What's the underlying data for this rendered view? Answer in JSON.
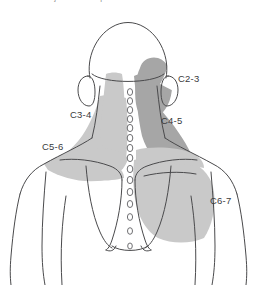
{
  "figure": {
    "title_clipped": "Cervical facet joint referral patterns",
    "view": "posterior view of head, neck and upper back",
    "background_color": "#ffffff",
    "outline_color": "#4a4a4c",
    "zone_fill_light": "#c9c9c9",
    "zone_fill_dark": "#a6a6a6",
    "label_color": "#3a3a3c"
  },
  "labels": [
    {
      "id": "c2-3",
      "text": "C2-3",
      "x": 178,
      "y": 82
    },
    {
      "id": "c3-4",
      "text": "C3-4",
      "x": 70,
      "y": 118
    },
    {
      "id": "c4-5",
      "text": "C4-5",
      "x": 161,
      "y": 124
    },
    {
      "id": "c5-6",
      "text": "C5-6",
      "x": 42,
      "y": 150
    },
    {
      "id": "c6-7",
      "text": "C6-7",
      "x": 210,
      "y": 204
    }
  ],
  "spine": {
    "name": "cervicothoracic spinous processes",
    "marker_color": "#6f6f72",
    "markers": [
      {
        "cx": 130,
        "cy": 92,
        "rx": 2.6,
        "ry": 3.4
      },
      {
        "cx": 130,
        "cy": 101,
        "rx": 2.6,
        "ry": 3.4
      },
      {
        "cx": 130,
        "cy": 110,
        "rx": 2.7,
        "ry": 3.5
      },
      {
        "cx": 130,
        "cy": 119,
        "rx": 2.7,
        "ry": 3.5
      },
      {
        "cx": 130,
        "cy": 128,
        "rx": 2.8,
        "ry": 3.6
      },
      {
        "cx": 130,
        "cy": 138,
        "rx": 2.8,
        "ry": 3.6
      },
      {
        "cx": 130,
        "cy": 148,
        "rx": 2.8,
        "ry": 3.6
      },
      {
        "cx": 130,
        "cy": 158,
        "rx": 2.8,
        "ry": 3.6
      },
      {
        "cx": 130,
        "cy": 169,
        "rx": 2.8,
        "ry": 3.6
      },
      {
        "cx": 130,
        "cy": 180,
        "rx": 2.8,
        "ry": 3.6
      },
      {
        "cx": 130,
        "cy": 192,
        "rx": 2.8,
        "ry": 3.6
      },
      {
        "cx": 130,
        "cy": 204,
        "rx": 2.7,
        "ry": 3.5
      },
      {
        "cx": 130,
        "cy": 217,
        "rx": 2.6,
        "ry": 3.4
      },
      {
        "cx": 130,
        "cy": 231,
        "rx": 2.5,
        "ry": 3.3
      },
      {
        "cx": 130,
        "cy": 246,
        "rx": 2.3,
        "ry": 3.0
      }
    ]
  },
  "zones": [
    {
      "id": "zone-c2-3",
      "label": "C2-3",
      "shade": "dark"
    },
    {
      "id": "zone-c3-4",
      "label": "C3-4",
      "shade": "light"
    },
    {
      "id": "zone-c4-5",
      "label": "C4-5",
      "shade": "dark"
    },
    {
      "id": "zone-c5-6",
      "label": "C5-6",
      "shade": "light"
    },
    {
      "id": "zone-c6-7",
      "label": "C6-7",
      "shade": "light"
    }
  ]
}
